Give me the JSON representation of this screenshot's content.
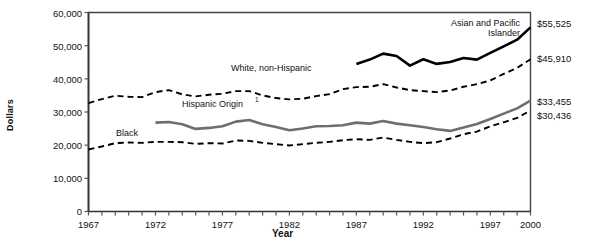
{
  "chart_data": {
    "type": "line",
    "title": "",
    "xlabel": "Year",
    "ylabel": "Dollars",
    "xlim": [
      1967,
      2000
    ],
    "ylim": [
      0,
      60000
    ],
    "grid": false,
    "legend_position": "inline-annotations",
    "y_ticks": [
      0,
      10000,
      20000,
      30000,
      40000,
      50000,
      60000
    ],
    "y_tick_labels": [
      "0",
      "10,000",
      "20,000",
      "30,000",
      "40,000",
      "50,000",
      "60,000"
    ],
    "x_ticks": [
      1967,
      1968,
      1969,
      1970,
      1971,
      1972,
      1973,
      1974,
      1975,
      1976,
      1977,
      1978,
      1979,
      1980,
      1981,
      1982,
      1983,
      1984,
      1985,
      1986,
      1987,
      1988,
      1989,
      1990,
      1991,
      1992,
      1993,
      1994,
      1995,
      1996,
      1997,
      1998,
      1999,
      2000
    ],
    "x_tick_labels": [
      "1967",
      "1972",
      "1977",
      "1982",
      "1987",
      "1992",
      "1997",
      "2000"
    ],
    "x_tick_label_years": [
      1967,
      1972,
      1977,
      1982,
      1987,
      1992,
      1997,
      2000
    ],
    "series": [
      {
        "name": "Asian and Pacific Islander",
        "label": "Asian and Pacific Islander",
        "label_lines": [
          "Asian and Pacific",
          "Islander"
        ],
        "style": "solid-thick-black",
        "color": "#000000",
        "end_value_label": "$55,525",
        "end_value": 55525,
        "x": [
          1987,
          1988,
          1989,
          1990,
          1991,
          1992,
          1993,
          1994,
          1995,
          1996,
          1997,
          1998,
          1999,
          2000
        ],
        "values": [
          44500,
          45800,
          47600,
          46900,
          44000,
          45900,
          44500,
          45100,
          46300,
          45800,
          47800,
          49800,
          51800,
          55525
        ]
      },
      {
        "name": "White, non-Hispanic",
        "label": "White, non-Hispanic",
        "label_lines": [
          "White, non-Hispanic"
        ],
        "style": "dashed-black",
        "color": "#000000",
        "end_value_label": "$45,910",
        "end_value": 45910,
        "x": [
          1967,
          1968,
          1969,
          1970,
          1971,
          1972,
          1973,
          1974,
          1975,
          1976,
          1977,
          1978,
          1979,
          1980,
          1981,
          1982,
          1983,
          1984,
          1985,
          1986,
          1987,
          1988,
          1989,
          1990,
          1991,
          1992,
          1993,
          1994,
          1995,
          1996,
          1997,
          1998,
          1999,
          2000
        ],
        "values": [
          32700,
          33900,
          34900,
          34600,
          34500,
          36000,
          36600,
          35300,
          34700,
          35200,
          35500,
          36300,
          36300,
          35000,
          34200,
          33800,
          34000,
          34800,
          35400,
          36900,
          37500,
          37600,
          38400,
          37400,
          36600,
          36300,
          36000,
          36500,
          37600,
          38400,
          39500,
          41500,
          43300,
          45910
        ]
      },
      {
        "name": "Hispanic Origin",
        "label": "Hispanic Origin",
        "label_lines": [
          "Hispanic Origin"
        ],
        "label_superscript": "1",
        "style": "solid-thick-gray",
        "color": "#6e6e6e",
        "end_value_label": "$33,455",
        "end_value": 33455,
        "x": [
          1972,
          1973,
          1974,
          1975,
          1976,
          1977,
          1978,
          1979,
          1980,
          1981,
          1982,
          1983,
          1984,
          1985,
          1986,
          1987,
          1988,
          1989,
          1990,
          1991,
          1992,
          1993,
          1994,
          1995,
          1996,
          1997,
          1998,
          1999,
          2000
        ],
        "values": [
          26800,
          27000,
          26300,
          24900,
          25200,
          25700,
          27100,
          27600,
          26300,
          25500,
          24500,
          25000,
          25700,
          25800,
          26000,
          26800,
          26500,
          27300,
          26500,
          26000,
          25500,
          24800,
          24300,
          25300,
          26400,
          27900,
          29500,
          31100,
          33455
        ]
      },
      {
        "name": "Black",
        "label": "Black",
        "label_lines": [
          "Black"
        ],
        "style": "dashed-black",
        "color": "#000000",
        "end_value_label": "$30,436",
        "end_value": 30436,
        "x": [
          1967,
          1968,
          1969,
          1970,
          1971,
          1972,
          1973,
          1974,
          1975,
          1976,
          1977,
          1978,
          1979,
          1980,
          1981,
          1982,
          1983,
          1984,
          1985,
          1986,
          1987,
          1988,
          1989,
          1990,
          1991,
          1992,
          1993,
          1994,
          1995,
          1996,
          1997,
          1998,
          1999,
          2000
        ],
        "values": [
          18700,
          19600,
          20600,
          20800,
          20700,
          21000,
          21000,
          20900,
          20400,
          20600,
          20500,
          21400,
          21300,
          20700,
          20300,
          19900,
          20300,
          20700,
          21000,
          21500,
          21800,
          21600,
          22300,
          21600,
          21000,
          20600,
          20900,
          22000,
          23300,
          24100,
          25700,
          26900,
          28200,
          30436
        ]
      }
    ],
    "axis_color": "#555555",
    "text_color": "#111111"
  },
  "annotations": {
    "asian_label_line1": "Asian and Pacific",
    "asian_label_line2": "Islander",
    "white_label": "White, non-Hispanic",
    "hispanic_label": "Hispanic Origin",
    "hispanic_superscript": "1",
    "black_label": "Black"
  },
  "end_labels": {
    "asian": "$55,525",
    "white": "$45,910",
    "hispanic": "$33,455",
    "black": "$30,436"
  },
  "axis_titles": {
    "y": "Dollars",
    "x": "Year"
  },
  "y_tick_labels": {
    "t0": "0",
    "t1": "10,000",
    "t2": "20,000",
    "t3": "30,000",
    "t4": "40,000",
    "t5": "50,000",
    "t6": "60,000"
  },
  "x_tick_labels": {
    "t1967": "1967",
    "t1972": "1972",
    "t1977": "1977",
    "t1982": "1982",
    "t1987": "1987",
    "t1992": "1992",
    "t1997": "1997",
    "t2000": "2000"
  }
}
